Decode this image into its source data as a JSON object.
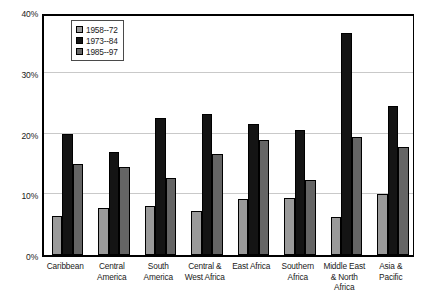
{
  "chart_data": {
    "type": "bar",
    "title": "",
    "subtitle": "",
    "xlabel": "",
    "ylabel": "",
    "ylim": [
      0,
      40
    ],
    "ytick_labels": [
      "0%",
      "10%",
      "20%",
      "30%",
      "40%"
    ],
    "ytick_values": [
      0,
      10,
      20,
      30,
      40
    ],
    "grid": true,
    "grid_axis": "y",
    "legend_position": "upper-left-inside",
    "categories": [
      "Caribbean",
      "Central America",
      "South America",
      "Central & West Africa",
      "East Africa",
      "Southern Africa",
      "Middle East & North Africa",
      "Asia & Pacific"
    ],
    "category_lines": [
      [
        "Caribbean"
      ],
      [
        "Central",
        "America"
      ],
      [
        "South",
        "America"
      ],
      [
        "Central &",
        "West Africa"
      ],
      [
        "East Africa"
      ],
      [
        "Southern",
        "Africa"
      ],
      [
        "Middle East",
        "& North",
        "Africa"
      ],
      [
        "Asia &",
        "Pacific"
      ]
    ],
    "series": [
      {
        "name": "1958--72",
        "color": "#9a9a9a",
        "values": [
          6.5,
          7.7,
          8.0,
          7.3,
          9.2,
          9.4,
          6.3,
          10.0
        ]
      },
      {
        "name": "1973--84",
        "color": "#141414",
        "values": [
          20.0,
          17.0,
          22.5,
          23.2,
          21.5,
          20.5,
          36.5,
          24.5
        ]
      },
      {
        "name": "1985--97",
        "color": "#656565",
        "values": [
          15.0,
          14.5,
          12.7,
          16.7,
          19.0,
          12.3,
          19.5,
          17.8
        ]
      }
    ]
  },
  "legend": {
    "items": [
      {
        "label": "1958--72",
        "color": "#9a9a9a"
      },
      {
        "label": "1973--84",
        "color": "#141414"
      },
      {
        "label": "1985--97",
        "color": "#656565"
      }
    ]
  }
}
